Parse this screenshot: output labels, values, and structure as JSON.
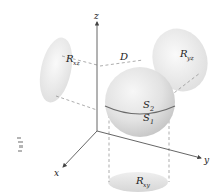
{
  "figure": {
    "axes": {
      "x_label": "x",
      "y_label": "y",
      "z_label": "z"
    },
    "region_label": "D",
    "surfaces": {
      "upper": {
        "main": "S",
        "sub": "2"
      },
      "lower": {
        "main": "S",
        "sub": "1"
      }
    },
    "projections": {
      "xz": {
        "main": "R",
        "sub": "xz"
      },
      "yz": {
        "main": "R",
        "sub": "yz"
      },
      "xy": {
        "main": "R",
        "sub": "xy"
      }
    },
    "colors": {
      "axis": "#555555",
      "equator": "#6a6a6a",
      "sphere_light": "#f4f4f4",
      "sphere_dark": "#c9c9c9",
      "projection_fill": "#e6e6e6",
      "dashed": "#888888"
    }
  }
}
